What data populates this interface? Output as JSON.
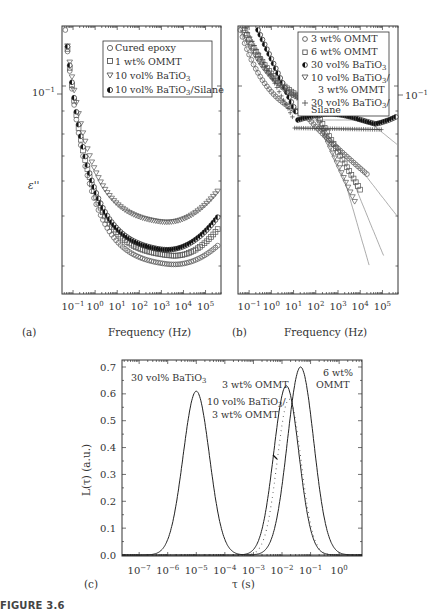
{
  "figure": {
    "caption": "FIGURE 3.6"
  },
  "chart_data": [
    {
      "panel": "(a)",
      "type": "scatter",
      "xlabel": "Frequency (Hz)",
      "ylabel": "ε''",
      "xscale": "log",
      "yscale": "log",
      "xlim": [
        0.03,
        500000
      ],
      "x_ticks": [
        "10^-1",
        "10^0",
        "10^1",
        "10^2",
        "10^3",
        "10^4",
        "10^5"
      ],
      "y_ticks": [
        "10^-1"
      ],
      "legend_position": "top-right",
      "series": [
        {
          "name": "Cured epoxy",
          "marker": "circle-open",
          "min_at_logf": 3.2,
          "min_depth": 0.93
        },
        {
          "name": "1 wt% OMMT",
          "marker": "square-open",
          "min_at_logf": 3.3,
          "min_depth": 0.8
        },
        {
          "name": "10 vol% BaTiO3",
          "marker": "triangle-down-open",
          "min_at_logf": 2.9,
          "min_depth": 0.56
        },
        {
          "name": "10 vol% BaTiO3/Silane",
          "marker": "circle-half",
          "min_at_logf": 2.9,
          "min_depth": 0.7
        }
      ]
    },
    {
      "panel": "(b)",
      "type": "scatter",
      "xlabel": "Frequency (Hz)",
      "ylabel": "",
      "xscale": "log",
      "yscale": "log",
      "xlim": [
        0.03,
        500000
      ],
      "x_ticks": [
        "10^-1",
        "10^0",
        "10^1",
        "10^2",
        "10^3",
        "10^4",
        "10^5"
      ],
      "y_ticks": [
        "10^-1"
      ],
      "legend_position": "top-right",
      "series": [
        {
          "name": "3 wt% OMMT",
          "marker": "circle-open",
          "with_fit_line": true
        },
        {
          "name": "6 wt% OMMT",
          "marker": "square-open",
          "with_fit_line": true
        },
        {
          "name": "30 vol% BaTiO3",
          "marker": "circle-half",
          "with_fit_line": true
        },
        {
          "name": "10 vol% BaTiO3/ 3 wt% OMMT",
          "marker": "triangle-down-open",
          "with_fit_line": true
        },
        {
          "name": "30 vol% BaTiO3/ Silane",
          "marker": "plus",
          "with_fit_line": false
        }
      ]
    },
    {
      "panel": "(c)",
      "type": "line",
      "title": "",
      "xlabel": "τ (s)",
      "ylabel": "L(τ) (a.u.)",
      "xscale": "log",
      "xlim_log10": [
        -7.6,
        0.8
      ],
      "ylim": [
        0.0,
        0.72
      ],
      "x_ticks": [
        "10^-7",
        "10^-6",
        "10^-5",
        "10^-4",
        "10^-3",
        "10^-2",
        "10^-1",
        "10^0"
      ],
      "y_ticks": [
        "0.0",
        "0.1",
        "0.2",
        "0.3",
        "0.4",
        "0.5",
        "0.6",
        "0.7"
      ],
      "series": [
        {
          "name": "30 vol% BaTiO3",
          "style": "solid",
          "peak_log10_tau": -5.0,
          "peak_value": 0.61,
          "width_decades": 1.05
        },
        {
          "name": "10 vol% BaTiO3/ 3 wt% OMMT",
          "style": "dotted",
          "peak_log10_tau": -1.75,
          "peak_value": 0.58,
          "width_decades": 0.95
        },
        {
          "name": "3 wt% OMMT",
          "style": "solid",
          "peak_log10_tau": -1.85,
          "peak_value": 0.63,
          "width_decades": 1.0
        },
        {
          "name": "6 wt% OMMT",
          "style": "solid",
          "peak_log10_tau": -1.35,
          "peak_value": 0.7,
          "width_decades": 1.05
        }
      ],
      "annotations": [
        "30 vol% BaTiO3",
        "3 wt% OMMT",
        "10 vol% BaTiO3/",
        "3 wt% OMMT",
        "6 wt%",
        "OMMT"
      ]
    }
  ],
  "labels": {
    "a_tag": "(a)",
    "b_tag": "(b)",
    "c_tag": "(c)",
    "a_ylabel": "ε''",
    "a_xlabel": "Frequency (Hz)",
    "b_xlabel": "Frequency (Hz)",
    "c_xlabel": "τ (s)",
    "c_ylabel": "L(τ) (a.u.)",
    "ytick_a": "10",
    "ytick_b": "10",
    "ytick_exp": "−1",
    "a_legend": [
      "Cured epoxy",
      "1 wt% OMMT",
      "10 vol% BaTiO",
      "10 vol% BaTiO"
    ],
    "a_legend_tail": [
      "",
      "",
      "",
      "/Silane"
    ],
    "b_legend": [
      "3 wt% OMMT",
      "6 wt% OMMT",
      "30 vol% BaTiO",
      "10 vol% BaTiO",
      "3 wt% OMMT",
      "30 vol% BaTiO",
      "Silane"
    ],
    "c_annot_1": "30 vol% BaTiO",
    "c_annot_2": "3 wt% OMMT",
    "c_annot_3": "10 vol% BaTiO",
    "c_annot_4": "3 wt% OMMT",
    "c_annot_5": "6 wt%",
    "c_annot_6": "OMMT",
    "sub3": "3",
    "slash": "/"
  }
}
